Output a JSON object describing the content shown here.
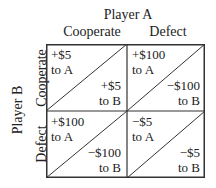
{
  "title": "Player A",
  "row_player": "Player B",
  "columns": [
    "Cooperate",
    "Defect"
  ],
  "rows": [
    "Cooperate",
    "Defect"
  ],
  "cells": [
    [
      {
        "a_amount": "+$5",
        "a_label": "to A",
        "b_amount": "+$5",
        "b_label": "to B"
      },
      {
        "a_amount": "+$100",
        "a_label": "to A",
        "b_amount": "−$100",
        "b_label": "to B"
      }
    ],
    [
      {
        "a_amount": "+$100",
        "a_label": "to A",
        "b_amount": "−$100",
        "b_label": "to B"
      },
      {
        "a_amount": "−$5",
        "a_label": "to A",
        "b_amount": "−$5",
        "b_label": "to B"
      }
    ]
  ],
  "colors": {
    "line": "#333333",
    "text": "#222222",
    "background": "#ffffff"
  }
}
